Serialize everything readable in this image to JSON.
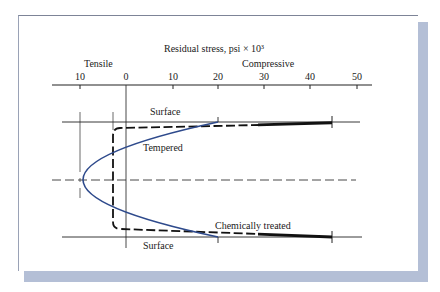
{
  "diagram": {
    "title": "Residual stress, psi × 10³",
    "axis": {
      "left_region_label": "Tensile",
      "right_region_label": "Compressive",
      "ticks": [
        {
          "label": "10",
          "value": -10
        },
        {
          "label": "0",
          "value": 0
        },
        {
          "label": "10",
          "value": 10
        },
        {
          "label": "20",
          "value": 20
        },
        {
          "label": "30",
          "value": 30
        },
        {
          "label": "40",
          "value": 40
        },
        {
          "label": "50",
          "value": 50
        }
      ]
    },
    "labels": {
      "surface_top": "Surface",
      "surface_bottom": "Surface",
      "tempered": "Tempered",
      "chemically_treated": "Chemically treated"
    },
    "curves": [
      {
        "name": "Tempered",
        "style": "solid",
        "color": "#2e4a8c",
        "surface_stress": 20,
        "center_stress": -10
      },
      {
        "name": "Chemically treated",
        "style": "dashed",
        "color": "#111111",
        "surface_stress": 45,
        "interior_stress": -3
      }
    ],
    "colors": {
      "frame_shadow": "#b4bfd6",
      "tempered_curve": "#2e4a8c",
      "line": "#111111"
    }
  }
}
